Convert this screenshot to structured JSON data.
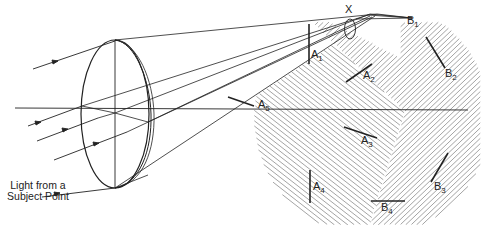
{
  "figure": {
    "caption": "Light from a Subject Point",
    "labels": {
      "x": "X",
      "a1": {
        "base": "A",
        "sub": "1"
      },
      "a2": {
        "base": "A",
        "sub": "2"
      },
      "a3": {
        "base": "A",
        "sub": "3"
      },
      "a4": {
        "base": "A",
        "sub": "4"
      },
      "a5": {
        "base": "A",
        "sub": "5"
      },
      "b1": {
        "base": "B",
        "sub": "1"
      },
      "b2": {
        "base": "B",
        "sub": "2"
      },
      "b3": {
        "base": "B",
        "sub": "3"
      },
      "b4": {
        "base": "B",
        "sub": "4"
      }
    },
    "colors": {
      "line": "#222222",
      "hatch": "#9a9a9a",
      "background": "#ffffff"
    }
  }
}
